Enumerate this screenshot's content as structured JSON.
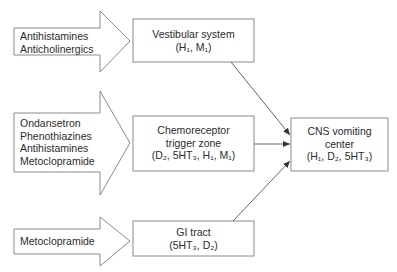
{
  "colors": {
    "stroke": "#8a8a8a",
    "connector": "#555555",
    "text": "#2b2b2b",
    "background": "#ffffff"
  },
  "arrows": [
    {
      "id": "vestibular-drugs",
      "lines": [
        "Antihistamines",
        "Anticholinergics"
      ]
    },
    {
      "id": "ctz-drugs",
      "lines": [
        "Ondansetron",
        "Phenothiazines",
        "Antihistamines",
        "Metoclopramide"
      ]
    },
    {
      "id": "gi-drugs",
      "lines": [
        "Metoclopramide"
      ]
    }
  ],
  "boxes": {
    "vestibular": {
      "title": "Vestibular system",
      "receptors": "(H₁, M₁)"
    },
    "ctz": {
      "title_line1": "Chemoreceptor",
      "title_line2": "trigger zone",
      "receptors": "(D₂, 5HT₃, H₁, M₁)"
    },
    "gi": {
      "title": "GI tract",
      "receptors": "(5HT₃, D₂)"
    },
    "cns": {
      "title_line1": "CNS vomiting",
      "title_line2": "center",
      "receptors": "(H₁, D₂, 5HT₃)"
    }
  }
}
